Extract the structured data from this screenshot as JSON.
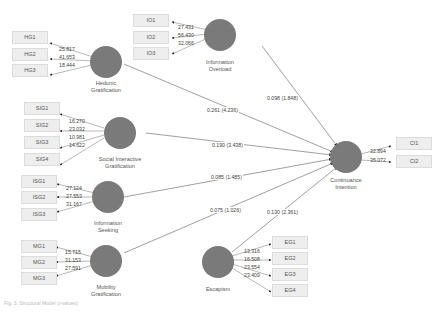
{
  "diagram": {
    "type": "structural-equation-model",
    "colors": {
      "construct_fill": "#7a7a7a",
      "indicator_fill": "#eeeeee",
      "line": "#888888"
    },
    "constructs": [
      {
        "id": "hg",
        "name": "Hedonic Gratification",
        "line1": "Hedonic",
        "line2": "Gratification",
        "indicators": [
          {
            "label": "HG1",
            "loading": "25.817"
          },
          {
            "label": "HG2",
            "loading": "41.653"
          },
          {
            "label": "HG3",
            "loading": "18.444"
          }
        ],
        "path": "0.261 (4.236)"
      },
      {
        "id": "io",
        "name": "Information Overload",
        "line1": "Information",
        "line2": "Overload",
        "indicators": [
          {
            "label": "IO1",
            "loading": "27.431"
          },
          {
            "label": "IO2",
            "loading": "56.430"
          },
          {
            "label": "IO3",
            "loading": "32.066"
          }
        ],
        "path": "0.098 (1.848)"
      },
      {
        "id": "sig",
        "name": "Social Interactive Gratification",
        "line1": "Social Interactive",
        "line2": "Gratification",
        "indicators": [
          {
            "label": "SIG1",
            "loading": "16.270"
          },
          {
            "label": "SIG2",
            "loading": "23.032"
          },
          {
            "label": "SIG3",
            "loading": "10.981"
          },
          {
            "label": "SIG4",
            "loading": "14.622"
          }
        ],
        "path": "0.190 (3.438)"
      },
      {
        "id": "isg",
        "name": "Information Seeking",
        "line1": "Information",
        "line2": "Seeking",
        "indicators": [
          {
            "label": "ISG1",
            "loading": "27.124"
          },
          {
            "label": "ISG2",
            "loading": "27.553"
          },
          {
            "label": "ISG3",
            "loading": "31.167"
          }
        ],
        "path": "0.085 (1.485)"
      },
      {
        "id": "mg",
        "name": "Mobility Gratification",
        "line1": "Mobility",
        "line2": "Gratification",
        "indicators": [
          {
            "label": "MG1",
            "loading": "15.715"
          },
          {
            "label": "MG2",
            "loading": "31.153"
          },
          {
            "label": "MG3",
            "loading": "27.591"
          }
        ],
        "path": "0.075 (1.026)"
      },
      {
        "id": "eg",
        "name": "Escapism",
        "line1": "Escapism",
        "line2": "",
        "indicators": [
          {
            "label": "EG1",
            "loading": "13.316"
          },
          {
            "label": "EG2",
            "loading": "16.508"
          },
          {
            "label": "EG3",
            "loading": "23.554"
          },
          {
            "label": "EG4",
            "loading": "23.409"
          }
        ],
        "path": "0.130 (2.361)"
      },
      {
        "id": "ci",
        "name": "Continuance Intention",
        "line1": "Continuance",
        "line2": "Intention",
        "indicators": [
          {
            "label": "CI1",
            "loading": "32.894"
          },
          {
            "label": "CI2",
            "loading": "35.072"
          }
        ]
      }
    ],
    "caption": "Fig. 3. Structural Model (t-values)"
  }
}
